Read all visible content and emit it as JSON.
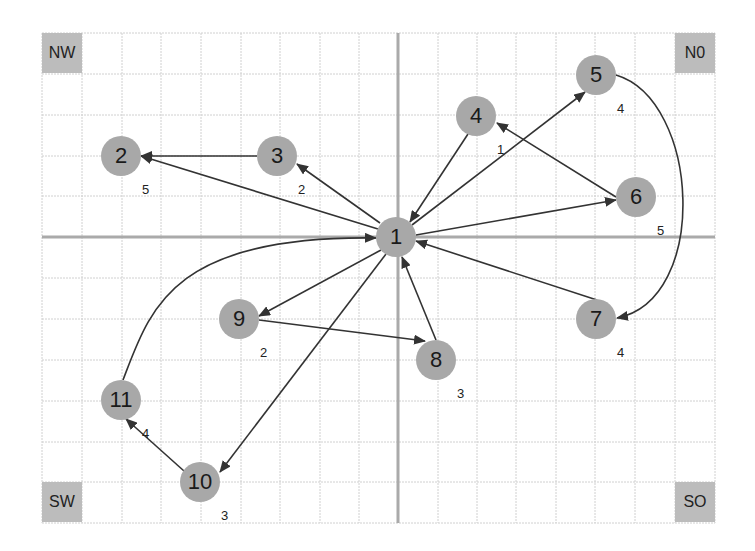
{
  "diagram": {
    "type": "directed-graph-on-grid",
    "grid": {
      "x_lines": [
        42,
        82,
        122,
        161,
        201,
        241,
        280,
        320,
        359,
        398,
        438,
        477,
        516,
        556,
        595,
        635,
        675,
        715
      ],
      "y_lines": [
        33,
        74,
        115,
        156,
        196,
        237,
        278,
        319,
        360,
        401,
        442,
        482,
        523
      ],
      "axis_x": 398,
      "axis_y": 237,
      "grid_color": "#d0d0d0",
      "axis_color": "#aaaaaa"
    },
    "corners": [
      {
        "id": "nw",
        "label": "NW",
        "x": 42,
        "y": 33
      },
      {
        "id": "no",
        "label": "N0",
        "x": 675,
        "y": 33
      },
      {
        "id": "sw",
        "label": "SW",
        "x": 42,
        "y": 482
      },
      {
        "id": "so",
        "label": "SO",
        "x": 675,
        "y": 482
      }
    ],
    "nodes": [
      {
        "id": "1",
        "label": "1",
        "x": 396,
        "y": 237,
        "weight": ""
      },
      {
        "id": "2",
        "label": "2",
        "x": 121,
        "y": 156,
        "weight": "5",
        "wx": 142,
        "wy": 190
      },
      {
        "id": "3",
        "label": "3",
        "x": 277,
        "y": 156,
        "weight": "2",
        "wx": 298,
        "wy": 190
      },
      {
        "id": "4",
        "label": "4",
        "x": 476,
        "y": 116,
        "weight": "1",
        "wx": 497,
        "wy": 150
      },
      {
        "id": "5",
        "label": "5",
        "x": 596,
        "y": 75,
        "weight": "4",
        "wx": 617,
        "wy": 109
      },
      {
        "id": "6",
        "label": "6",
        "x": 636,
        "y": 197,
        "weight": "5",
        "wx": 657,
        "wy": 231
      },
      {
        "id": "7",
        "label": "7",
        "x": 596,
        "y": 319,
        "weight": "4",
        "wx": 617,
        "wy": 353
      },
      {
        "id": "8",
        "label": "8",
        "x": 436,
        "y": 360,
        "weight": "3",
        "wx": 457,
        "wy": 394
      },
      {
        "id": "9",
        "label": "9",
        "x": 239,
        "y": 319,
        "weight": "2",
        "wx": 260,
        "wy": 353
      },
      {
        "id": "10",
        "label": "10",
        "x": 200,
        "y": 482,
        "weight": "3",
        "wx": 221,
        "wy": 516
      },
      {
        "id": "11",
        "label": "11",
        "x": 121,
        "y": 400,
        "weight": "4",
        "wx": 142,
        "wy": 434
      }
    ],
    "edges": [
      {
        "from": "1",
        "to": "2",
        "path": "M378,229 L141,156",
        "bidirectional": true
      },
      {
        "from": "3",
        "to": "2",
        "path": "M257,156 L141,156"
      },
      {
        "from": "1",
        "to": "3",
        "path": "M380,223 L297,164",
        "bidirectional": true
      },
      {
        "from": "4",
        "to": "1",
        "path": "M468,134 L410,222"
      },
      {
        "from": "1",
        "to": "5",
        "path": "M412,225 L585,92",
        "bidirectional": true
      },
      {
        "from": "6",
        "to": "4",
        "path": "M616,197 L497,123"
      },
      {
        "from": "1",
        "to": "6",
        "path": "M416,235 L616,200"
      },
      {
        "from": "7",
        "to": "1",
        "path": "M597,300 L416,241"
      },
      {
        "from": "5",
        "to": "7",
        "path": "M616,75 C700,100 710,300 617,318"
      },
      {
        "from": "1",
        "to": "9",
        "path": "M381,250 L259,316"
      },
      {
        "from": "9",
        "to": "8",
        "path": "M259,320 L425,341"
      },
      {
        "from": "8",
        "to": "1",
        "path": "M436,340 L402,257"
      },
      {
        "from": "1",
        "to": "10",
        "path": "M386,254 L220,472"
      },
      {
        "from": "10",
        "to": "11",
        "path": "M184,471 L126,419"
      },
      {
        "from": "11",
        "to": "1",
        "path": "M123,380 C150,310 170,235 376,238"
      }
    ],
    "colors": {
      "node_fill": "#a8a8a8",
      "edge": "#333333",
      "corner_fill": "#bcbcbc"
    }
  }
}
